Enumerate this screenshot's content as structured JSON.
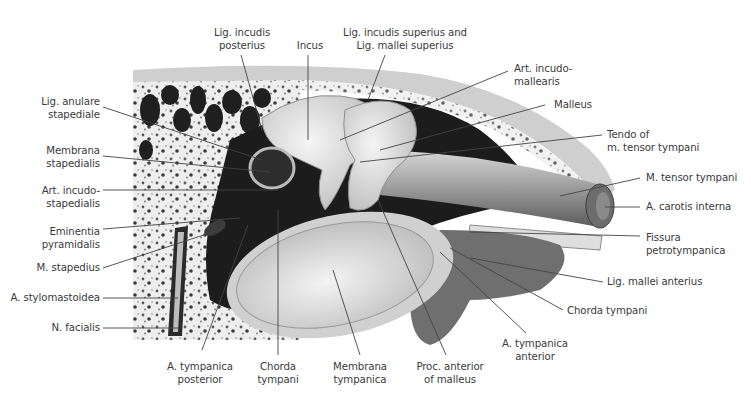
{
  "figure": {
    "colors": {
      "background": "#ffffff",
      "label_text": "#3a3a3a",
      "leader_line": "#444444",
      "bone_light": "#e6e6e6",
      "bone_dark": "#2a2a2a",
      "cavity": "#1c1c1c"
    }
  },
  "labels": {
    "left": [
      {
        "id": "lig-anulare-stapediale",
        "line1": "Lig. anulare",
        "line2": "stapediale"
      },
      {
        "id": "membrana-stapedialis",
        "line1": "Membrana",
        "line2": "stapedialis"
      },
      {
        "id": "art-incudo-stapedialis",
        "line1": "Art. incudo-",
        "line2": "stapedialis"
      },
      {
        "id": "eminentia-pyramidalis",
        "line1": "Eminentia",
        "line2": "pyramidalis"
      },
      {
        "id": "m-stapedius",
        "line1": "M. stapedius"
      },
      {
        "id": "a-stylomastoidea",
        "line1": "A. stylomastoidea"
      },
      {
        "id": "n-facialis",
        "line1": "N. facialis"
      }
    ],
    "top": [
      {
        "id": "lig-incudis-posterius",
        "line1": "Lig. incudis",
        "line2": "posterius"
      },
      {
        "id": "incus",
        "line1": "Incus"
      },
      {
        "id": "lig-incudis-superius",
        "line1": "Lig. incudis superius and",
        "line2": "Lig. mallei superius"
      }
    ],
    "right": [
      {
        "id": "art-incudo-mallearis",
        "line1": "Art. incudo-",
        "line2": "mallearis"
      },
      {
        "id": "malleus",
        "line1": "Malleus"
      },
      {
        "id": "tendo-tensor-tympani",
        "line1": "Tendo of",
        "line2": "m. tensor tympani"
      },
      {
        "id": "m-tensor-tympani",
        "line1": "M. tensor tympani"
      },
      {
        "id": "a-carotis-interna",
        "line1": "A. carotis interna"
      },
      {
        "id": "fissura-petrotympanica",
        "line1": "Fissura",
        "line2": "petrotympanica"
      },
      {
        "id": "lig-mallei-anterius",
        "line1": "Lig. mallei anterius"
      },
      {
        "id": "chorda-tympani-right",
        "line1": "Chorda tympani"
      },
      {
        "id": "a-tympanica-anterior",
        "line1": "A. tympanica",
        "line2": "anterior"
      }
    ],
    "bottom": [
      {
        "id": "a-tympanica-posterior",
        "line1": "A. tympanica",
        "line2": "posterior"
      },
      {
        "id": "chorda-tympani-bottom",
        "line1": "Chorda",
        "line2": "tympani"
      },
      {
        "id": "membrana-tympanica",
        "line1": "Membrana",
        "line2": "tympanica"
      },
      {
        "id": "proc-anterior-malleus",
        "line1": "Proc. anterior",
        "line2": "of malleus"
      }
    ]
  }
}
